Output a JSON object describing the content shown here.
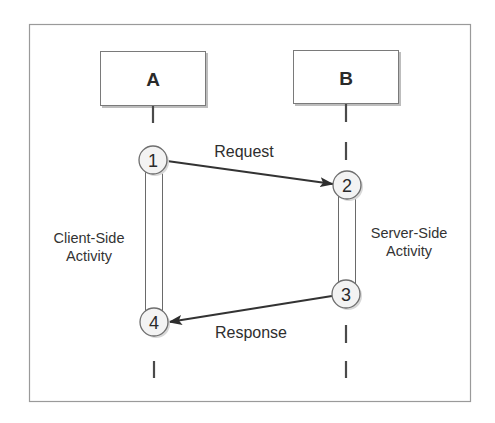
{
  "diagram": {
    "type": "sequence-diagram",
    "participants": [
      {
        "id": "A",
        "label": "A"
      },
      {
        "id": "B",
        "label": "B"
      }
    ],
    "steps": [
      {
        "number": "1",
        "participant": "A"
      },
      {
        "number": "2",
        "participant": "B"
      },
      {
        "number": "3",
        "participant": "B"
      },
      {
        "number": "4",
        "participant": "A"
      }
    ],
    "messages": [
      {
        "from_step": "1",
        "to_step": "2",
        "label": "Request"
      },
      {
        "from_step": "3",
        "to_step": "4",
        "label": "Response"
      }
    ],
    "activities": [
      {
        "participant": "A",
        "line1": "Client-Side",
        "line2": "Activity"
      },
      {
        "participant": "B",
        "line1": "Server-Side",
        "line2": "Activity"
      }
    ]
  },
  "colors": {
    "frame": "#9a9a9a",
    "box_border": "#7a7a7a",
    "text": "#2a2a2a",
    "node_fill": "#f3f3f3",
    "arrow": "#333333"
  }
}
